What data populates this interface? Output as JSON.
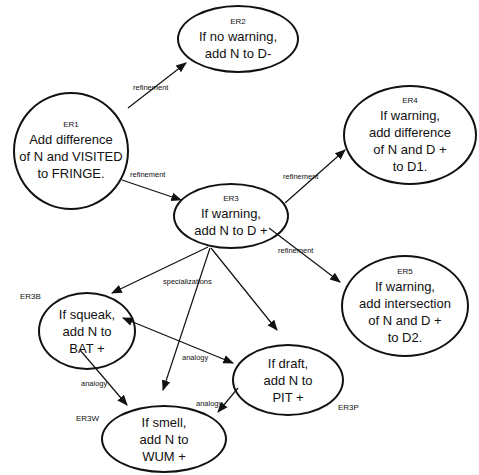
{
  "diagram": {
    "type": "rule-refinement-graph",
    "nodes": [
      {
        "id": "ER1",
        "lines": [
          "Add difference",
          "of N and VISITED",
          "to FRINGE."
        ]
      },
      {
        "id": "ER2",
        "lines": [
          "If no warning,",
          "add N to D-"
        ]
      },
      {
        "id": "ER3",
        "lines": [
          "If warning,",
          "add N to D +"
        ]
      },
      {
        "id": "ER4",
        "lines": [
          "If warning,",
          "add difference",
          "of N and D +",
          "to D1."
        ]
      },
      {
        "id": "ER5",
        "lines": [
          "If warning,",
          "add  intersection",
          "of N and D +",
          "to D2."
        ]
      },
      {
        "id": "ER3B",
        "lines": [
          "If squeak,",
          "add N to",
          "BAT +"
        ]
      },
      {
        "id": "ER3P",
        "lines": [
          "If draft,",
          "add N to",
          "PIT +"
        ]
      },
      {
        "id": "ER3W",
        "lines": [
          "If smell,",
          "add N to",
          "WUM +"
        ]
      }
    ],
    "edges": [
      {
        "from": "ER1",
        "to": "ER2",
        "label": "refinement"
      },
      {
        "from": "ER1",
        "to": "ER3",
        "label": "refinement"
      },
      {
        "from": "ER3",
        "to": "ER4",
        "label": "refinement"
      },
      {
        "from": "ER3",
        "to": "ER5",
        "label": "refinement"
      },
      {
        "from": "ER3",
        "to": "ER3B",
        "label": "specializations"
      },
      {
        "from": "ER3",
        "to": "ER3W",
        "label": "specializations"
      },
      {
        "from": "ER3",
        "to": "ER3P",
        "label": "specializations"
      },
      {
        "from": "ER3B",
        "to": "ER3P",
        "label": "analogy",
        "bidirectional": true
      },
      {
        "from": "ER3B",
        "to": "ER3W",
        "label": "analogy"
      },
      {
        "from": "ER3P",
        "to": "ER3W",
        "label": "analogy"
      }
    ],
    "labels": {
      "refinement": "refinement",
      "specializations": "specializations",
      "analogy": "analogy"
    }
  }
}
